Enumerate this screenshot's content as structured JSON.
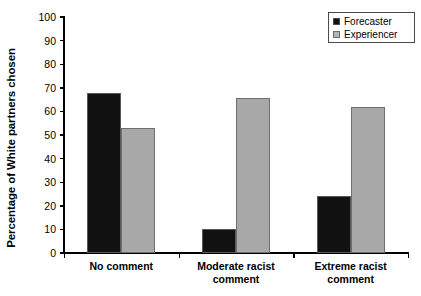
{
  "chart_data": {
    "type": "bar",
    "title": "",
    "xlabel": "",
    "ylabel": "Percentage of White partners chosen",
    "ylim": [
      0,
      100
    ],
    "ytick_step": 10,
    "grid": false,
    "legend_position": "top-right",
    "categories": [
      "No comment",
      "Moderate racist\ncomment",
      "Extreme racist\ncomment"
    ],
    "yticks": [
      "0",
      "10",
      "20",
      "30",
      "40",
      "50",
      "60",
      "70",
      "80",
      "90",
      "100"
    ],
    "series": [
      {
        "name": "Forecaster",
        "color": "#111111",
        "values": [
          68,
          10,
          24
        ]
      },
      {
        "name": "Experiencer",
        "color": "#a8a8a8",
        "values": [
          53,
          65.5,
          62
        ]
      }
    ]
  },
  "legend": {
    "items": [
      {
        "label": "Forecaster",
        "swatch": "black-square-swatch"
      },
      {
        "label": "Experiencer",
        "swatch": "gray-square-swatch"
      }
    ]
  }
}
